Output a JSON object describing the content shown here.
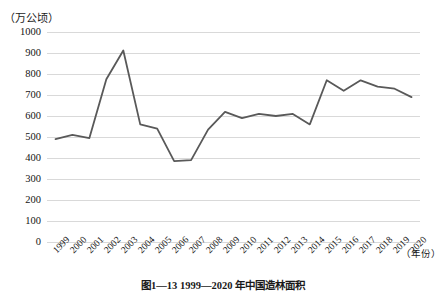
{
  "figure": {
    "caption": "图1—13  1999—2020 年中国造林面积",
    "y_axis_unit": "（万公顷）",
    "x_axis_unit": "（年份）"
  },
  "chart_data": {
    "type": "line",
    "title": "图1—13  1999—2020 年中国造林面积",
    "xlabel": "（年份）",
    "ylabel": "（万公顷）",
    "ylim": [
      0,
      1000
    ],
    "ytick_step": 100,
    "yticks": [
      1000,
      900,
      800,
      700,
      600,
      500,
      400,
      300,
      200,
      100,
      0
    ],
    "grid": true,
    "grid_axis": "y",
    "legend": false,
    "line_color": "#595959",
    "line_width": 1.8,
    "markers": false,
    "categories": [
      "1999",
      "2000",
      "2001",
      "2002",
      "2003",
      "2004",
      "2005",
      "2006",
      "2007",
      "2008",
      "2009",
      "2010",
      "2011",
      "2012",
      "2013",
      "2014",
      "2015",
      "2016",
      "2017",
      "2018",
      "2019",
      "2020"
    ],
    "values": [
      490,
      510,
      495,
      775,
      912,
      560,
      540,
      385,
      390,
      535,
      620,
      590,
      610,
      600,
      610,
      560,
      770,
      720,
      770,
      740,
      730,
      690
    ],
    "series": [
      {
        "name": "中国造林面积",
        "values": [
          490,
          510,
          495,
          775,
          912,
          560,
          540,
          385,
          390,
          535,
          620,
          590,
          610,
          600,
          610,
          560,
          770,
          720,
          770,
          740,
          730,
          690
        ]
      }
    ]
  }
}
